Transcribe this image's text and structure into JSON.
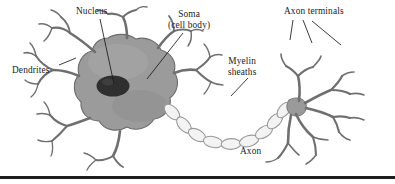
{
  "figure": {
    "kind": "neuron-anatomy-diagram",
    "background_color": "#ffffff",
    "ink_color": "#1a1a1a",
    "soma_fill": "#9a9a9a",
    "soma_outline": "#6d6d6d",
    "nucleus_fill": "#2e2e2e",
    "dendrite_outline": "#6f6f6f",
    "dendrite_fill": "#ffffff",
    "myelin_fill": "#f2f2f2",
    "myelin_outline": "#9b9b9b",
    "rule_color": "#1c1c1c"
  },
  "labels": {
    "nucleus": "Nucleus",
    "soma_line1": "Soma",
    "soma_line2": "(cell body)",
    "dendrites": "Dendrites",
    "axon_terminals": "Axon terminals",
    "myelin_line1": "Myelin",
    "myelin_line2": "sheaths",
    "axon": "Axon"
  },
  "parts": [
    {
      "name": "nucleus",
      "label": "Nucleus",
      "description": "dark ellipse at centre of soma"
    },
    {
      "name": "soma",
      "label": "Soma (cell body)",
      "description": "large grey cell body"
    },
    {
      "name": "dendrites",
      "label": "Dendrites",
      "description": "branching processes on the left"
    },
    {
      "name": "myelin-sheaths",
      "label": "Myelin sheaths",
      "description": "chain of oval segments along the axon"
    },
    {
      "name": "axon",
      "label": "Axon",
      "description": "long fibre running right from the soma"
    },
    {
      "name": "axon-terminals",
      "label": "Axon terminals",
      "description": "branched endings at the right"
    }
  ]
}
